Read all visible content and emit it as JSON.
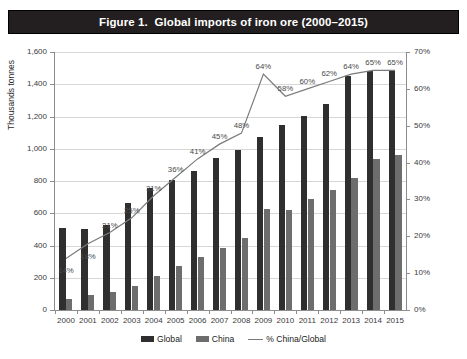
{
  "title": "Figure 1.  Global imports of iron ore (2000–2015)",
  "axes": {
    "yleft_title": "Thousands tonnes",
    "yleft_ticks": [
      "0",
      "200",
      "400",
      "600",
      "800",
      "1,000",
      "1,200",
      "1,400",
      "1,600"
    ],
    "yright_ticks": [
      "0%",
      "10%",
      "20%",
      "30%",
      "40%",
      "50%",
      "60%",
      "70%"
    ]
  },
  "legend": {
    "global": "Global",
    "china": "China",
    "ratio": "% China/Global"
  },
  "colors": {
    "global_bar": "#2f2f2f",
    "china_bar": "#6d6d6d",
    "line": "#7a7a7a",
    "title_bar": "#231f20",
    "grid": "#d7d7d7"
  },
  "chart_data": {
    "type": "bar",
    "title": "Figure 1.  Global imports of iron ore (2000–2015)",
    "xlabel": "",
    "ylabel": "Thousands tonnes",
    "y2label": "",
    "ylim": [
      0,
      1600
    ],
    "y2lim": [
      0,
      70
    ],
    "grid": true,
    "legend_position": "bottom",
    "categories": [
      "2000",
      "2001",
      "2002",
      "2003",
      "2004",
      "2005",
      "2006",
      "2007",
      "2008",
      "2009",
      "2010",
      "2011",
      "2012",
      "2013",
      "2014",
      "2015"
    ],
    "series": [
      {
        "name": "Global",
        "axis": "left",
        "unit": "Thousands tonnes",
        "type": "bar",
        "values": [
          510,
          505,
          530,
          665,
          755,
          805,
          865,
          940,
          990,
          1070,
          1145,
          1205,
          1280,
          1450,
          1480,
          1480
        ]
      },
      {
        "name": "China",
        "axis": "left",
        "unit": "Thousands tonnes",
        "type": "bar",
        "values": [
          70,
          92,
          111,
          148,
          208,
          275,
          326,
          383,
          444,
          628,
          619,
          686,
          745,
          820,
          935,
          960
        ]
      },
      {
        "name": "% China/Global",
        "axis": "right",
        "unit": "%",
        "type": "line",
        "values": [
          14,
          18,
          21,
          25,
          31,
          36,
          41,
          45,
          48,
          64,
          58,
          60,
          62,
          64,
          65,
          65
        ],
        "data_labels": [
          "14%",
          "18%",
          "21%",
          "25%",
          "31%",
          "36%",
          "41%",
          "45%",
          "48%",
          "64%",
          "58%",
          "60%",
          "62%",
          "64%",
          "65%",
          "65%"
        ]
      }
    ]
  }
}
